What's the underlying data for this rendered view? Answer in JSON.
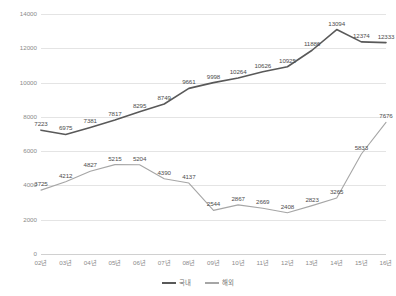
{
  "chart_data": {
    "type": "line",
    "title": "",
    "xlabel": "",
    "ylabel": "",
    "ylim": [
      0,
      14000
    ],
    "grid": true,
    "legend_position": "bottom",
    "categories": [
      "02년",
      "03년",
      "04년",
      "05년",
      "06년",
      "07년",
      "08년",
      "09년",
      "10년",
      "11년",
      "12년",
      "13년",
      "14년",
      "15년",
      "16년"
    ],
    "yticks": [
      "0",
      "2000",
      "4000",
      "6000",
      "8000",
      "10000",
      "12000",
      "14000"
    ],
    "ytick_values": [
      0,
      2000,
      4000,
      6000,
      8000,
      10000,
      12000,
      14000
    ],
    "series": [
      {
        "name": "국내",
        "color": "#595959",
        "values": [
          7223,
          6975,
          7381,
          7817,
          8295,
          8749,
          9661,
          9998,
          10264,
          10626,
          10925,
          11886,
          13094,
          12374,
          12333
        ],
        "labels": [
          "7223",
          "6975",
          "7381",
          "7817",
          "8295",
          "8749",
          "9661",
          "9998",
          "10264",
          "10626",
          "10925",
          "11886",
          "13094",
          "12374",
          "12333"
        ]
      },
      {
        "name": "해외",
        "color": "#a6a6a6",
        "values": [
          3725,
          4212,
          4827,
          5215,
          5204,
          4390,
          4137,
          2544,
          2867,
          2669,
          2408,
          2823,
          3265,
          5833,
          7676
        ],
        "labels": [
          "3725",
          "4212",
          "4827",
          "5215",
          "5204",
          "4390",
          "4137",
          "2544",
          "2867",
          "2669",
          "2408",
          "2823",
          "3265",
          "5833",
          "7676"
        ]
      }
    ]
  }
}
